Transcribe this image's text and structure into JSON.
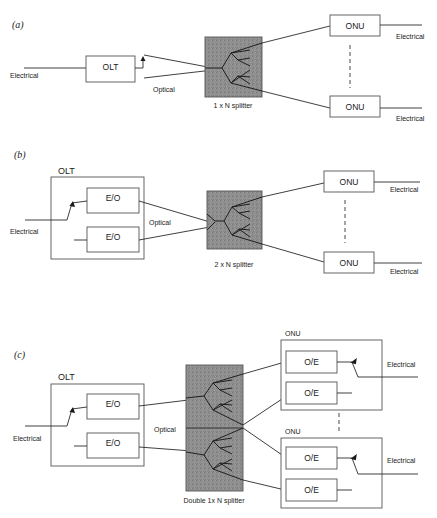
{
  "panels": {
    "a": {
      "tag": "(a)",
      "olt_label": "OLT",
      "input_label": "Electrical",
      "medium_label": "Optical",
      "splitter_label": "1 x N splitter",
      "onu_top_label": "ONU",
      "onu_bottom_label": "ONU",
      "output_top_label": "Electrical",
      "output_bottom_label": "Electrical"
    },
    "b": {
      "tag": "(b)",
      "olt_label": "OLT",
      "eo_top_label": "E/O",
      "eo_bottom_label": "E/O",
      "input_label": "Electrical",
      "medium_label": "Optical",
      "splitter_label": "2 x N splitter",
      "onu_top_label": "ONU",
      "onu_bottom_label": "ONU",
      "output_top_label": "Electrical",
      "output_bottom_label": "Electrical"
    },
    "c": {
      "tag": "(c)",
      "olt_label": "OLT",
      "eo_top_label": "E/O",
      "eo_bottom_label": "E/O",
      "input_label": "Electrical",
      "medium_label": "Optical",
      "splitter_label": "Double 1x N splitter",
      "onu_top": {
        "label": "ONU",
        "oe_top_label": "O/E",
        "oe_bottom_label": "O/E",
        "output_label": "Electrical"
      },
      "onu_bottom": {
        "label": "ONU",
        "oe_top_label": "O/E",
        "oe_bottom_label": "O/E",
        "output_label": "Electrical"
      }
    }
  },
  "colors": {
    "splitter_fill": "#8c8c8c",
    "line": "#2a2a2a",
    "box_border": "#555555"
  }
}
